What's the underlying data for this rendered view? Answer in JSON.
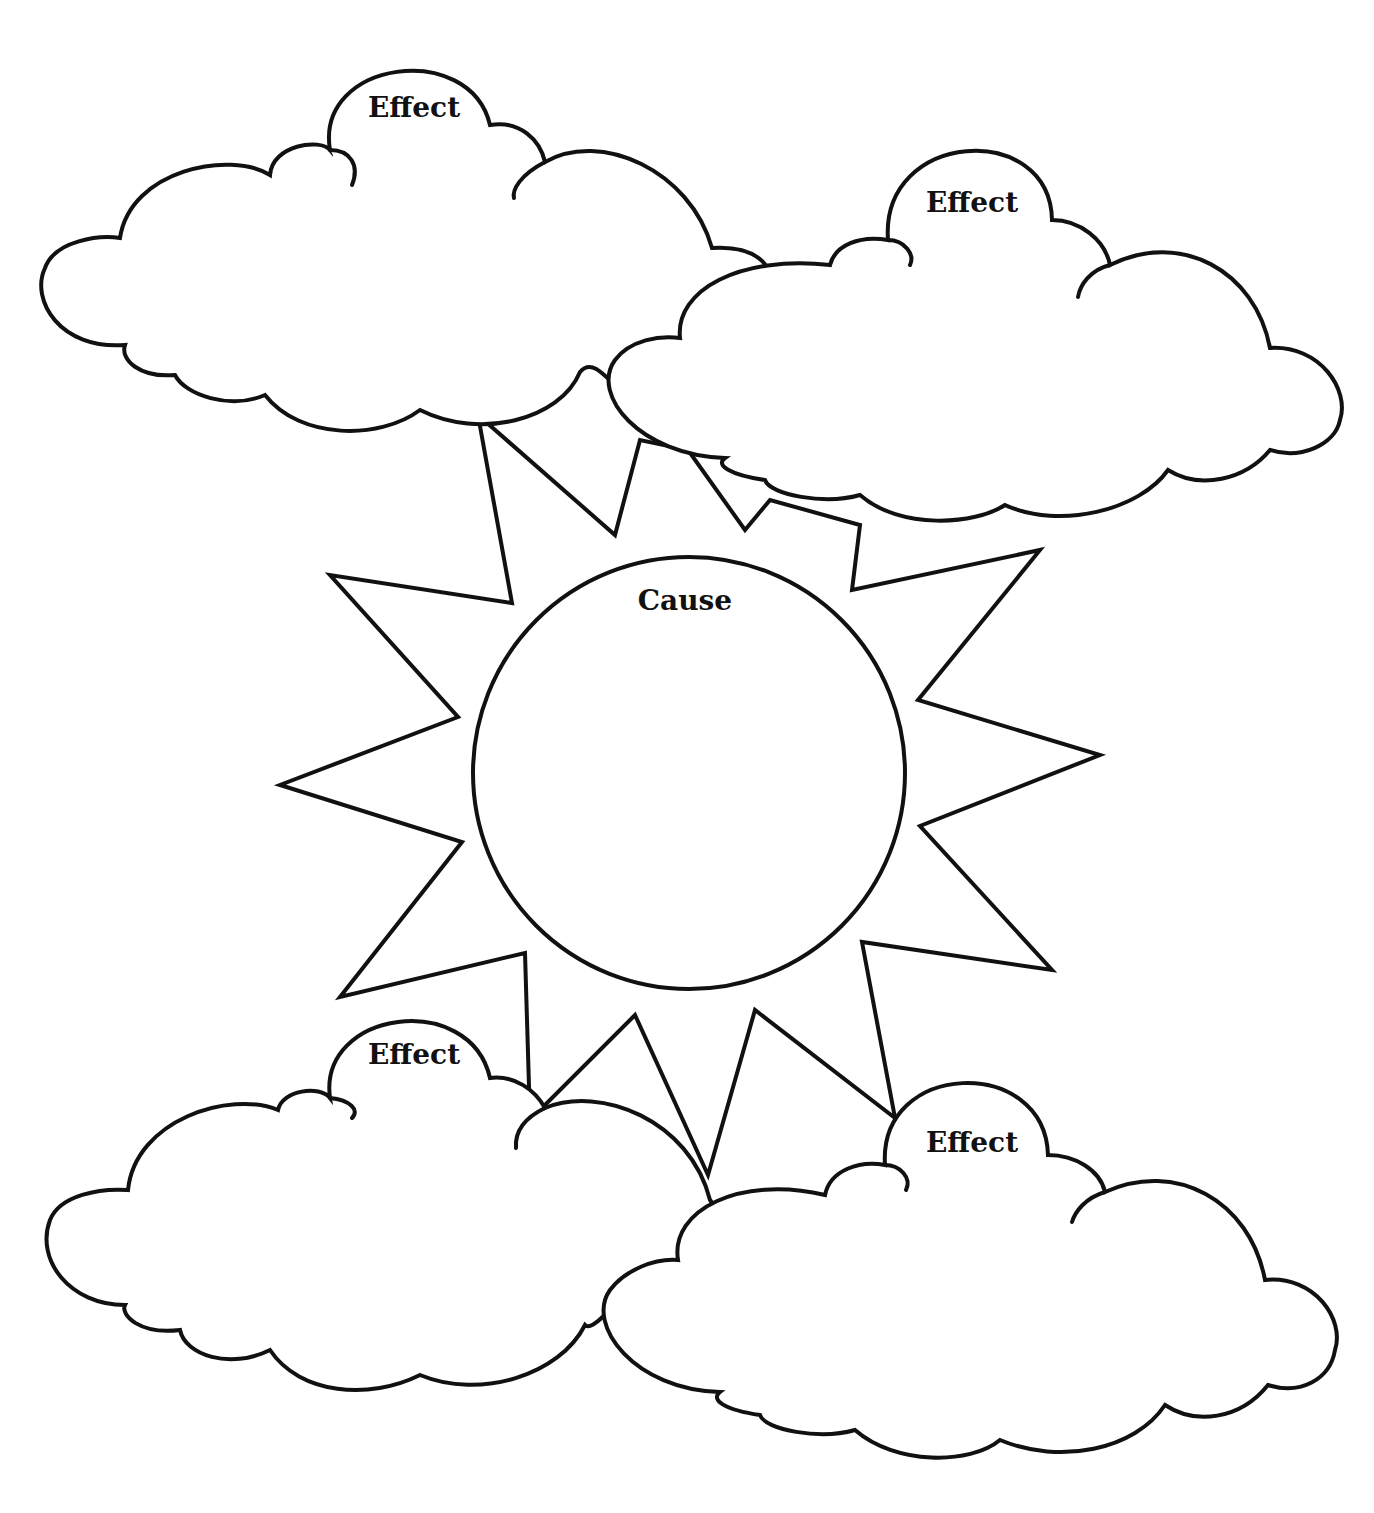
{
  "diagram": {
    "type": "cause-and-effect graphic organizer",
    "cause": {
      "label": "Cause"
    },
    "effects": [
      {
        "label": "Effect"
      },
      {
        "label": "Effect"
      },
      {
        "label": "Effect"
      },
      {
        "label": "Effect"
      }
    ],
    "colors": {
      "line": "#111111",
      "background": "#ffffff"
    }
  }
}
